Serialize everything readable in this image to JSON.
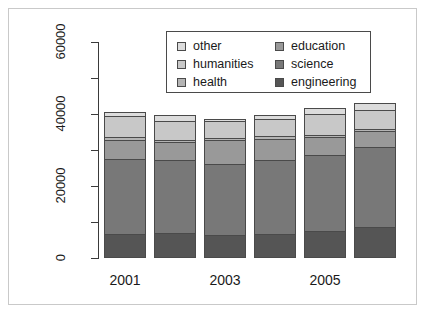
{
  "chart_data": {
    "type": "bar",
    "subtype": "stacked-vertical",
    "title": "",
    "xlabel": "",
    "ylabel": "",
    "categories": [
      "2001",
      "2002",
      "2003",
      "2004",
      "2005",
      "2006"
    ],
    "visible_tick_labels": [
      "2001",
      "2003",
      "2005"
    ],
    "ylim": [
      0,
      60000
    ],
    "ytick_labels": [
      "0",
      "20000",
      "40000",
      "60000"
    ],
    "ytick_values": [
      0,
      20000,
      40000,
      60000
    ],
    "yminor_tick_values": [
      10000,
      30000,
      50000
    ],
    "grid": false,
    "legend_position": "top-center",
    "series": [
      {
        "name": "engineering",
        "color": "#555555",
        "values": [
          6800,
          7000,
          6300,
          6800,
          7600,
          8600
        ]
      },
      {
        "name": "science",
        "color": "#787878",
        "values": [
          21000,
          20500,
          20200,
          20800,
          21400,
          22600
        ]
      },
      {
        "name": "education",
        "color": "#999999",
        "values": [
          5600,
          5300,
          6900,
          6100,
          5100,
          4700
        ]
      },
      {
        "name": "health",
        "color": "#b4b4b4",
        "values": [
          1000,
          900,
          900,
          900,
          900,
          900
        ]
      },
      {
        "name": "humanities",
        "color": "#c8c8c8",
        "values": [
          6100,
          5600,
          4900,
          5100,
          6100,
          5400
        ]
      },
      {
        "name": "other",
        "color": "#dcdcdc",
        "values": [
          1500,
          1700,
          800,
          1300,
          1900,
          2300
        ]
      }
    ],
    "stack_order_bottom_to_top": [
      "engineering",
      "science",
      "education",
      "health",
      "humanities",
      "other"
    ],
    "totals": [
      42000,
      41000,
      40000,
      41000,
      43000,
      44500
    ]
  },
  "legend": {
    "columns": [
      {
        "entries": [
          {
            "label": "other",
            "color": "#dcdcdc"
          },
          {
            "label": "humanities",
            "color": "#c8c8c8"
          },
          {
            "label": "health",
            "color": "#b4b4b4"
          }
        ]
      },
      {
        "entries": [
          {
            "label": "education",
            "color": "#999999"
          },
          {
            "label": "science",
            "color": "#787878"
          },
          {
            "label": "engineering",
            "color": "#555555"
          }
        ]
      }
    ]
  },
  "axis": {
    "y_labels": [
      "0",
      "20000",
      "40000",
      "60000"
    ],
    "x_labels": [
      "2001",
      "2003",
      "2005"
    ]
  },
  "colors": {
    "axis": "#3a3a3a",
    "bar_outline": "#4a4a4a",
    "frame": "#c9c9c9",
    "background": "#ffffff",
    "text": "#1a1a1a"
  }
}
